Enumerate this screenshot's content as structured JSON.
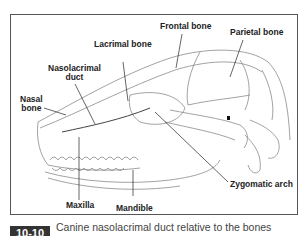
{
  "figure": {
    "number": "10-10",
    "caption": "Canine nasolacrimal duct relative to the bones",
    "labels": {
      "frontal_bone": "Frontal bone",
      "parietal_bone": "Parietal bone",
      "lacrimal_bone": "Lacrimal bone",
      "nasolacrimal_duct_1": "Nasolacrimal",
      "nasolacrimal_duct_2": "duct",
      "nasal_bone_1": "Nasal",
      "nasal_bone_2": "bone",
      "maxilla": "Maxilla",
      "mandible": "Mandible",
      "zygomatic_arch": "Zygomatic arch"
    },
    "colors": {
      "frame": "#555555",
      "badge": "#333333",
      "caption": "#444444",
      "leader": "#222222",
      "sketch": "#8a8a8a"
    }
  }
}
